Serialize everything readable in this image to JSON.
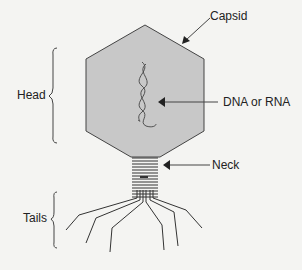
{
  "diagram": {
    "colors": {
      "background": "#f4f4f2",
      "capsid_fill": "#c8c8c8",
      "stroke": "#333333"
    },
    "labels": {
      "capsid": "Capsid",
      "nucleic_acid": "DNA or RNA",
      "neck": "Neck",
      "head": "Head",
      "tails": "Tails"
    }
  }
}
